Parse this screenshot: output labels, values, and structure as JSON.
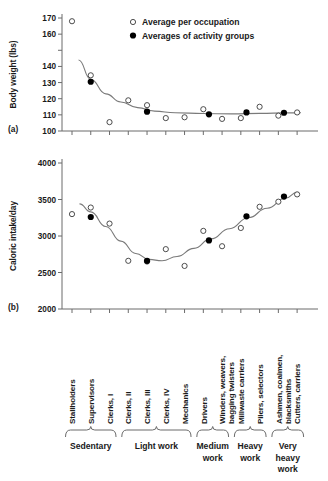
{
  "figure": {
    "panel_a_label": "(a)",
    "panel_b_label": "(b)"
  },
  "legend": {
    "items": [
      {
        "marker": "open-circle",
        "label": "Average per occupation"
      },
      {
        "marker": "filled-circle",
        "label": "Averages of activity groups"
      }
    ]
  },
  "colors": {
    "axis": "#6b6b6b",
    "curve": "#7a7a7a",
    "marker_open_stroke": "#3a3a3a",
    "marker_filled": "#000000",
    "text": "#1a1a1a",
    "bracket": "#6b6b6b"
  },
  "occupations": [
    "Stallholders",
    "Supervisors",
    "Clerks, I",
    "Clerks, II",
    "Clerks, III",
    "Clerks, IV",
    "Mechanics",
    "Drivers",
    "Winders, weavers,\nbagging twisters",
    "Millwaste carriers",
    "Pilers, selectors",
    "Ashmen, coalmen,\nblacksmiths",
    "Cutters, carriers"
  ],
  "activity_groups": [
    {
      "label": "Sedentary",
      "from": 0,
      "to": 2
    },
    {
      "label": "Light work",
      "from": 3,
      "to": 6
    },
    {
      "label": "Medium\nwork",
      "from": 7,
      "to": 8
    },
    {
      "label": "Heavy\nwork",
      "from": 9,
      "to": 10
    },
    {
      "label": "Very\nheavy\nwork",
      "from": 11,
      "to": 12
    }
  ],
  "chart_data": [
    {
      "type": "scatter",
      "panel": "a",
      "title": "",
      "xlabel": "",
      "ylabel": "Body weight (lbs)",
      "ylim": [
        100,
        170
      ],
      "yticks": [
        100,
        110,
        120,
        130,
        140,
        150,
        160,
        170
      ],
      "ytick_labels": [
        "100",
        "110",
        "120",
        "130",
        "140",
        "",
        "160",
        "170"
      ],
      "grid": false,
      "legend_position": "top-right",
      "x": [
        1,
        2,
        3,
        4,
        5,
        6,
        7,
        8,
        9,
        10,
        11,
        12,
        13
      ],
      "series": [
        {
          "name": "Average per occupation",
          "marker": "open-circle",
          "values": [
            168,
            134.5,
            105.5,
            119,
            116,
            108,
            108.5,
            113.5,
            107.5,
            108,
            115,
            109.5,
            111.5
          ]
        },
        {
          "name": "Averages of activity groups",
          "marker": "filled-circle",
          "x": [
            2,
            5,
            8.3,
            10.3,
            12.3
          ],
          "values": [
            130.5,
            112,
            110.3,
            111.5,
            111.3
          ]
        }
      ],
      "trend_curve": {
        "description": "smooth decreasing curve flattening near 111",
        "points": [
          [
            1.35,
            144
          ],
          [
            2,
            132
          ],
          [
            2.8,
            123
          ],
          [
            3.6,
            118
          ],
          [
            4.5,
            114.5
          ],
          [
            5.4,
            112.3
          ],
          [
            6.5,
            111.3
          ],
          [
            8,
            110.8
          ],
          [
            9.5,
            110.6
          ],
          [
            11,
            110.9
          ],
          [
            12.5,
            111.2
          ],
          [
            13.2,
            111.3
          ]
        ]
      }
    },
    {
      "type": "scatter",
      "panel": "b",
      "title": "",
      "xlabel": "",
      "ylabel": "Caloric intake/day",
      "ylim": [
        2000,
        4000
      ],
      "yticks": [
        2000,
        2500,
        3000,
        3500,
        4000
      ],
      "ytick_labels": [
        "2000",
        "2500",
        "3000",
        "3500",
        "4000"
      ],
      "grid": false,
      "x": [
        1,
        2,
        3,
        4,
        5,
        6,
        7,
        8,
        9,
        10,
        11,
        12,
        13
      ],
      "series": [
        {
          "name": "Average per occupation",
          "marker": "open-circle",
          "values": [
            3300,
            3390,
            3170,
            2660,
            2650,
            2820,
            2590,
            3070,
            2860,
            3110,
            3400,
            3470,
            3570
          ]
        },
        {
          "name": "Averages of activity groups",
          "marker": "filled-circle",
          "x": [
            2,
            5,
            8.3,
            10.3,
            12.3
          ],
          "values": [
            3260,
            2660,
            2940,
            3270,
            3540
          ]
        }
      ],
      "trend_curve": {
        "description": "U-shaped curve, minimum near Clerks III, rising steeply to the right",
        "points": [
          [
            1.4,
            3440
          ],
          [
            2,
            3330
          ],
          [
            2.8,
            3130
          ],
          [
            3.6,
            2930
          ],
          [
            4.4,
            2760
          ],
          [
            5.1,
            2680
          ],
          [
            5.8,
            2660
          ],
          [
            6.6,
            2720
          ],
          [
            7.5,
            2830
          ],
          [
            8.4,
            2960
          ],
          [
            9.4,
            3100
          ],
          [
            10.4,
            3250
          ],
          [
            11.4,
            3380
          ],
          [
            12.4,
            3520
          ],
          [
            13.0,
            3600
          ]
        ]
      }
    }
  ]
}
